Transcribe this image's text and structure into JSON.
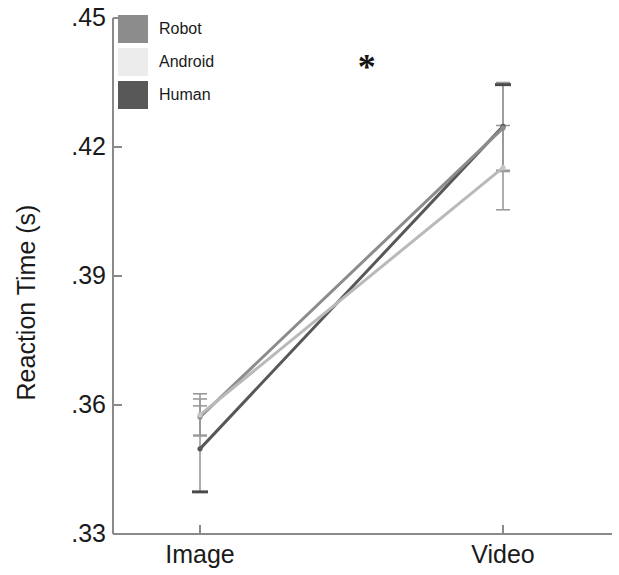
{
  "chart_data": {
    "type": "line",
    "title": "",
    "xlabel": "",
    "ylabel": "Reaction Time (s)",
    "categories": [
      "Image",
      "Video"
    ],
    "x": [
      0,
      1
    ],
    "ylim": [
      0.33,
      0.45
    ],
    "ytick_values": [
      0.45,
      0.42,
      0.39,
      0.36,
      0.33
    ],
    "ytick_labels": [
      ".45",
      ".42",
      ".39",
      ".36",
      ".33"
    ],
    "xtick_labels": [
      "Image",
      "Video"
    ],
    "grid": false,
    "legend_position": "upper-left-inside",
    "error_bar_type": "standard error",
    "series": [
      {
        "name": "Robot",
        "color": "#8c8c8c",
        "values": [
          0.3572,
          0.4244
        ],
        "errors": [
          0.0042,
          0.0101
        ]
      },
      {
        "name": "Android",
        "color": "#ececec",
        "values": [
          0.3577,
          0.4152
        ],
        "errors": [
          0.0049,
          0.0098
        ]
      },
      {
        "name": "Human",
        "color": "#585858",
        "values": [
          0.3498,
          0.4248
        ],
        "errors": [
          0.01,
          0.0102
        ]
      }
    ],
    "annotations": [
      {
        "text": "*",
        "x": 0.55,
        "y": 0.4385,
        "meaning": "significant-difference"
      }
    ]
  },
  "legend": {
    "items": [
      {
        "label": "Robot",
        "color": "#8c8c8c"
      },
      {
        "label": "Android",
        "color": "#ececec"
      },
      {
        "label": "Human",
        "color": "#585858"
      }
    ]
  },
  "axes": {
    "y_label": "Reaction Time (s)",
    "y_ticks": [
      ".45",
      ".42",
      ".39",
      ".36",
      ".33"
    ],
    "x_ticks": [
      "Image",
      "Video"
    ]
  },
  "colors": {
    "axis": "#8a8a8a",
    "text": "#1a1a1a",
    "background": "#ffffff",
    "error_bar": "#9a9a9a"
  }
}
